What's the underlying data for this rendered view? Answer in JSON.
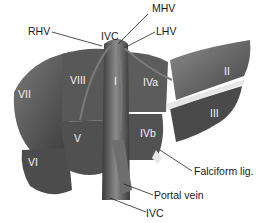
{
  "figure": {
    "colors": {
      "lobe_dark": "#4a4a4a",
      "lobe_mid": "#6a6a6a",
      "lobe_light": "#8c8c8c",
      "vessel": "#5a5a5a",
      "ligament": "#e0e0e0",
      "leader": "#222222"
    }
  },
  "labels": {
    "mhv": "MHV",
    "rhv": "RHV",
    "ivc_top": "IVC",
    "lhv": "LHV",
    "falciform": "Falciform lig.",
    "portal_vein": "Portal vein",
    "ivc_bottom": "IVC"
  },
  "segments": {
    "I": "I",
    "II": "II",
    "III": "III",
    "IVa": "IVa",
    "IVb": "IVb",
    "V": "V",
    "VI": "VI",
    "VII": "VII",
    "VIII": "VIII"
  }
}
